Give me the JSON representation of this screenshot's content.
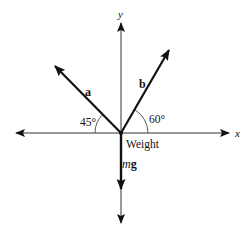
{
  "diagram": {
    "type": "free-body-force-diagram",
    "origin": {
      "x": 121,
      "y": 133
    },
    "axes": {
      "x_label": "x",
      "y_label": "y"
    },
    "vectors": [
      {
        "id": "a",
        "label": "a",
        "angle_deg": 45,
        "side": "left",
        "angle_label": "45°"
      },
      {
        "id": "b",
        "label": "b",
        "angle_deg": 60,
        "side": "right",
        "angle_label": "60°"
      },
      {
        "id": "mg",
        "label_italic": "m",
        "label_bold": "g",
        "direction": "down",
        "caption": "Weight"
      }
    ]
  },
  "colors": {
    "ink": "#111111",
    "axis": "#333333",
    "background": "#ffffff"
  }
}
